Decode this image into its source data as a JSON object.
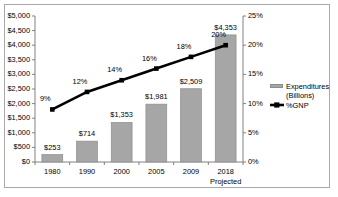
{
  "chart_data": {
    "type": "bar",
    "title": "",
    "subtitle": "",
    "xlabel": "",
    "ylabel": "",
    "categories": [
      "1980",
      "1990",
      "2000",
      "2005",
      "2009",
      "2018"
    ],
    "x_sub_labels": [
      "",
      "",
      "",
      "",
      "",
      "Projected"
    ],
    "grid": false,
    "legend_position": "right",
    "series": [
      {
        "name": "Expenditures (Billions)",
        "type": "bar",
        "axis": "left",
        "color": "#a6a6a6",
        "values": [
          253,
          714,
          1353,
          1981,
          2509,
          4353
        ],
        "data_labels": [
          "$253",
          "$714",
          "$1,353",
          "$1,981",
          "$2,509",
          "$4,353"
        ]
      },
      {
        "name": "%GNP",
        "type": "line",
        "axis": "right",
        "color": "#000000",
        "values": [
          9,
          12,
          14,
          16,
          18,
          20
        ],
        "data_labels": [
          "9%",
          "12%",
          "14%",
          "16%",
          "18%",
          "20%"
        ]
      }
    ],
    "left_axis": {
      "min": 0,
      "max": 5000,
      "step": 500,
      "tick_labels": [
        "$0",
        "$500",
        "$1,000",
        "$1,500",
        "$2,000",
        "$2,500",
        "$3,000",
        "$3,500",
        "$4,000",
        "$4,500",
        "$5,000"
      ]
    },
    "right_axis": {
      "min": 0,
      "max": 25,
      "step": 5,
      "tick_labels": [
        "0%",
        "5%",
        "10%",
        "15%",
        "20%",
        "25%"
      ]
    }
  },
  "legend": {
    "items": [
      {
        "label_line1": "Expenditures",
        "label_line2": "(Billions)",
        "marker": "bar-swatch",
        "color": "#a6a6a6"
      },
      {
        "label_line1": "%GNP",
        "label_line2": "",
        "marker": "line-marker",
        "color": "#000000"
      }
    ]
  }
}
